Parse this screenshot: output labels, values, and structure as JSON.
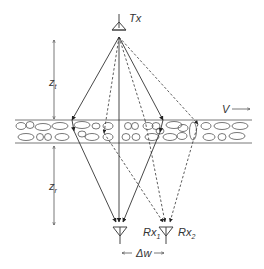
{
  "diagram": {
    "transmitter": {
      "label": "Tx"
    },
    "receivers": [
      {
        "label": "Rx",
        "subscript": "1"
      },
      {
        "label": "Rx",
        "subscript": "2"
      }
    ],
    "distances": {
      "transmitter_height": {
        "label": "z",
        "subscript": "t"
      },
      "receiver_depth": {
        "label": "z",
        "subscript": "r"
      },
      "receiver_spacing": {
        "label": "Δw"
      }
    },
    "velocity": {
      "label": "V"
    },
    "colors": {
      "line": "#333333",
      "background": "#ffffff"
    }
  }
}
